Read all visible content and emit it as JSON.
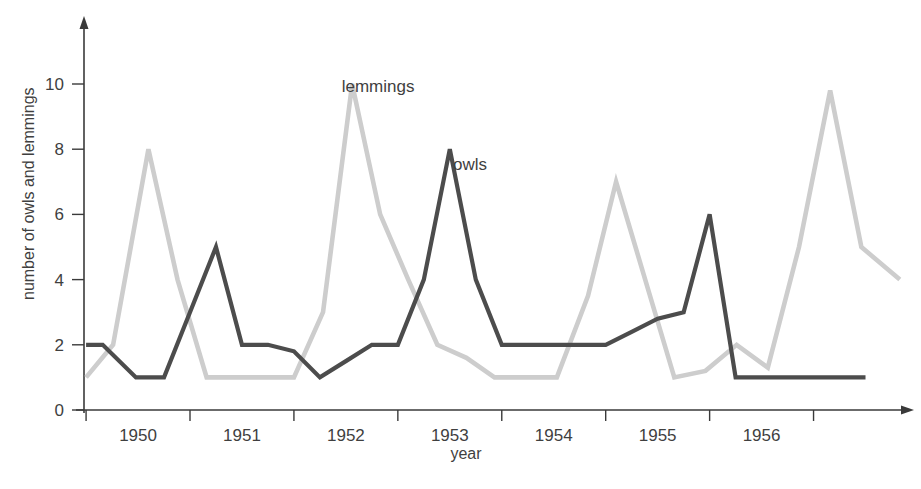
{
  "chart_data": {
    "type": "line",
    "title": "",
    "xlabel": "year",
    "ylabel": "number of owls and lemmings",
    "xlim": [
      1949.6,
      1957.5
    ],
    "ylim": [
      0,
      11.3
    ],
    "grid": false,
    "legend": "inline-annotations",
    "x_tick_labels": [
      "1950",
      "1951",
      "1952",
      "1953",
      "1954",
      "1955",
      "1956"
    ],
    "x_tick_values": [
      1950,
      1951,
      1952,
      1953,
      1954,
      1955,
      1956
    ],
    "y_tick_labels": [
      "0",
      "2",
      "4",
      "6",
      "8",
      "10"
    ],
    "y_tick_values": [
      0,
      2,
      4,
      6,
      8,
      10
    ],
    "series": [
      {
        "name": "owls",
        "color": "#4c4c4c",
        "label_text": "owls",
        "label_x": 1953.15,
        "label_y": 7.35,
        "x": [
          1949.62,
          1949.78,
          1950.1,
          1950.37,
          1950.62,
          1950.87,
          1951.12,
          1951.37,
          1951.62,
          1951.87,
          1952.12,
          1952.37,
          1952.62,
          1952.87,
          1953.12,
          1953.37,
          1953.62,
          1953.87,
          1954.12,
          1954.37,
          1954.62,
          1954.87,
          1955.12,
          1955.37,
          1955.62,
          1955.87,
          1956.12,
          1956.62,
          1957.12
        ],
        "y": [
          2,
          2,
          1,
          1,
          3,
          5,
          2,
          2,
          1.8,
          1,
          1.5,
          2,
          2,
          4,
          8,
          4,
          2,
          2,
          2,
          2,
          2,
          2.4,
          2.8,
          3,
          6,
          1,
          1,
          1,
          1
        ]
      },
      {
        "name": "lemmings",
        "color": "#cdcdcd",
        "label_text": "lemmings",
        "label_x": 1952.08,
        "label_y": 9.75,
        "x": [
          1949.62,
          1949.88,
          1950.22,
          1950.5,
          1950.78,
          1951.05,
          1951.33,
          1951.62,
          1951.9,
          1952.18,
          1952.45,
          1952.72,
          1953.0,
          1953.28,
          1953.55,
          1953.85,
          1954.15,
          1954.45,
          1954.72,
          1955.0,
          1955.28,
          1955.58,
          1955.88,
          1956.18,
          1956.48,
          1956.78,
          1957.08,
          1957.45
        ],
        "y": [
          1,
          2,
          8,
          4,
          1,
          1,
          1,
          1,
          3,
          10,
          6,
          4,
          2,
          1.6,
          1,
          1,
          1,
          3.5,
          7,
          4,
          1,
          1.2,
          2,
          1.3,
          5,
          9.8,
          5,
          4
        ]
      }
    ],
    "annotations": [
      {
        "text": "lemmings",
        "x": 1952.08,
        "y": 9.75
      },
      {
        "text": "owls",
        "x": 1953.15,
        "y": 7.35
      }
    ]
  },
  "axes": {
    "y_title": "number of owls and lemmings",
    "x_title": "year"
  }
}
